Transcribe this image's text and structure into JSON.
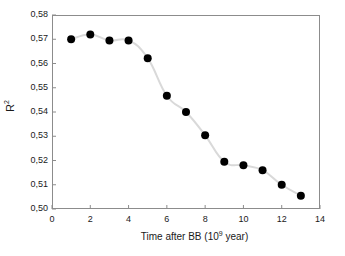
{
  "chart_data": {
    "type": "line",
    "title": "",
    "xlabel": "Time after BB (10⁹ year)",
    "xlabel_base": "Time after BB (10",
    "xlabel_exponent": "9",
    "xlabel_tail": " year)",
    "ylabel": "R²",
    "ylabel_base": "R",
    "ylabel_exponent": "2",
    "x": [
      1,
      2,
      3,
      4,
      5,
      6,
      7,
      8,
      9,
      10,
      11,
      12,
      13
    ],
    "values": [
      0.57,
      0.572,
      0.5695,
      0.5695,
      0.5622,
      0.5467,
      0.54,
      0.5304,
      0.5195,
      0.518,
      0.516,
      0.51,
      0.5055
    ],
    "xlim": [
      0,
      14
    ],
    "ylim": [
      0.5,
      0.58
    ],
    "xticks": [
      0,
      2,
      4,
      6,
      8,
      10,
      12,
      14
    ],
    "xtick_labels": [
      "0",
      "2",
      "4",
      "6",
      "8",
      "10",
      "12",
      "14"
    ],
    "yticks": [
      0.5,
      0.51,
      0.52,
      0.53,
      0.54,
      0.55,
      0.56,
      0.57,
      0.58
    ],
    "ytick_labels": [
      "0,50",
      "0,51",
      "0,52",
      "0,53",
      "0,54",
      "0,55",
      "0,56",
      "0,57",
      "0,58"
    ],
    "grid": false,
    "legend": null,
    "marker": "filled-circle",
    "marker_color": "#000000",
    "line_color": "#d9d9d9",
    "axis_color": "#8c8c8c",
    "background": "#ffffff"
  }
}
